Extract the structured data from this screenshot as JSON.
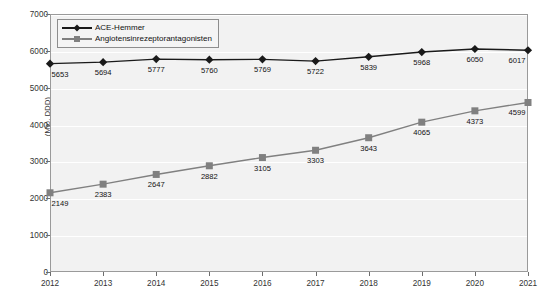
{
  "chart_data": {
    "type": "line",
    "title": "",
    "subtitle": "",
    "xlabel": "",
    "ylabel": "(Mio. DDD)",
    "categories": [
      "2012",
      "2013",
      "2014",
      "2015",
      "2016",
      "2017",
      "2018",
      "2019",
      "2020",
      "2021"
    ],
    "ylim": [
      0,
      7000
    ],
    "yticks": [
      "0",
      "1000",
      "2000",
      "3000",
      "4000",
      "5000",
      "6000",
      "7000"
    ],
    "grid": true,
    "legend_position": "top-left",
    "series": [
      {
        "name": "ACE-Hemmer",
        "marker": "diamond",
        "color": "#1a1a1a",
        "values": [
          5653,
          5694,
          5777,
          5760,
          5769,
          5722,
          5839,
          5968,
          6050,
          6017
        ],
        "labels": [
          "5653",
          "5694",
          "5777",
          "5760",
          "5769",
          "5722",
          "5839",
          "5968",
          "6050",
          "6017"
        ]
      },
      {
        "name": "Angiotensinrezeptorantagonisten",
        "marker": "square",
        "color": "#808080",
        "values": [
          2149,
          2383,
          2647,
          2882,
          3105,
          3303,
          3643,
          4065,
          4373,
          4599
        ],
        "labels": [
          "2149",
          "2383",
          "2647",
          "2882",
          "3105",
          "3303",
          "3643",
          "4065",
          "4373",
          "4599"
        ]
      }
    ]
  },
  "style": {
    "plot_background": "#f2f2f2",
    "page_background": "#ffffff",
    "gridline_color": "#ffffff",
    "axis_color": "#9a9a9a",
    "text_color": "#1a1a1a"
  }
}
